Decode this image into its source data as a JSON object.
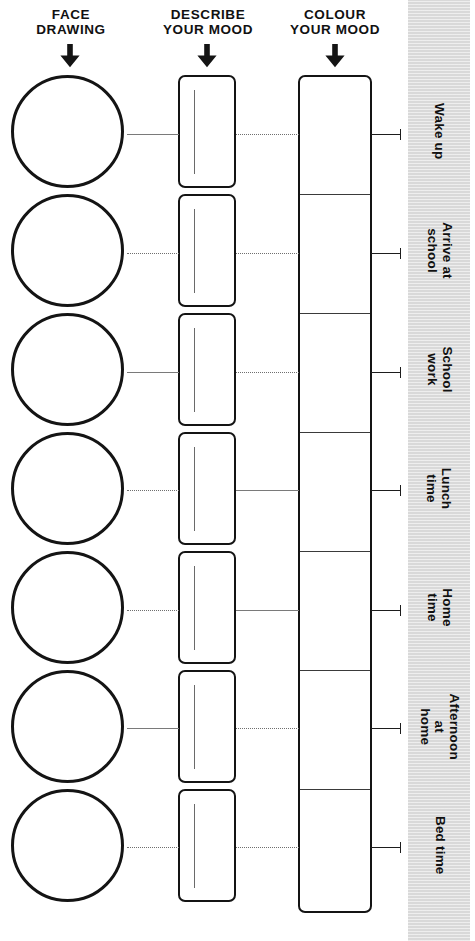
{
  "page": {
    "background_color": "#ffffff",
    "ink_color": "#141414",
    "band_color": "#d9d9d9",
    "width": 475,
    "height": 941
  },
  "columns": [
    {
      "id": "face-drawing",
      "header": "FACE\nDRAWING",
      "arrow_icon": "down-arrow-icon",
      "cell_type": "circle"
    },
    {
      "id": "describe-your-mood",
      "header": "DESCRIBE\nYOUR MOOD",
      "arrow_icon": "down-arrow-icon",
      "cell_type": "write-box"
    },
    {
      "id": "colour-your-mood",
      "header": "COLOUR\nYOUR MOOD",
      "arrow_icon": "down-arrow-icon",
      "cell_type": "colour-box"
    }
  ],
  "rows": [
    {
      "label": "Wake up"
    },
    {
      "label": "Arrive at\nschool"
    },
    {
      "label": "School work"
    },
    {
      "label": "Lunch\ntime"
    },
    {
      "label": "Home\ntime"
    },
    {
      "label": "Afternoon at\nhome"
    },
    {
      "label": "Bed time"
    }
  ],
  "geometry": {
    "row_tops": [
      75,
      194,
      313,
      432,
      551,
      670,
      789
    ],
    "row_height": 113,
    "row_pitch": 119,
    "connector_y": [
      134,
      253,
      372,
      490,
      610,
      728,
      847
    ],
    "divider_y": [
      194,
      313,
      432,
      551,
      670,
      789
    ],
    "grid_top": 75,
    "grid_bottom": 913
  }
}
